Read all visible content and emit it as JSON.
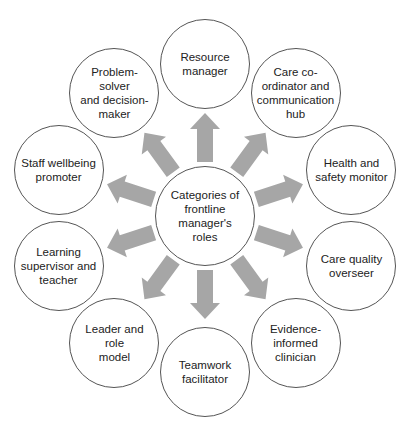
{
  "diagram": {
    "title": "Categories of frontline manager's roles",
    "center": {
      "label": "Categories of\nfrontline\nmanager's\nroles",
      "cx": 205,
      "cy": 216,
      "r": 50
    },
    "orbit": {
      "cx": 205,
      "cy": 218,
      "radius": 154,
      "node_radius": 45
    },
    "arrow_color": "#a6a6a6",
    "circle_stroke": "#555555",
    "text_color": "#222222",
    "roles": [
      {
        "id": "resource-manager",
        "label": "Resource\nmanager",
        "angle": 0
      },
      {
        "id": "care-coordinator",
        "label": "Care co-\nordinator and\ncommunication\nhub",
        "angle": 36
      },
      {
        "id": "health-safety-monitor",
        "label": "Health and\nsafety monitor",
        "angle": 72
      },
      {
        "id": "care-quality-overseer",
        "label": "Care quality\noverseer",
        "angle": 108
      },
      {
        "id": "evidence-informed-clinician",
        "label": "Evidence-\ninformed\nclinician",
        "angle": 144
      },
      {
        "id": "teamwork-facilitator",
        "label": "Teamwork\nfacilitator",
        "angle": 180
      },
      {
        "id": "leader-role-model",
        "label": "Leader and role\nmodel",
        "angle": 216
      },
      {
        "id": "learning-supervisor-teacher",
        "label": "Learning\nsupervisor and\nteacher",
        "angle": 252
      },
      {
        "id": "staff-wellbeing-promoter",
        "label": "Staff wellbeing\npromoter",
        "angle": 288
      },
      {
        "id": "problem-solver-decision-maker",
        "label": "Problem-solver\nand decision-\nmaker",
        "angle": 324
      }
    ]
  }
}
